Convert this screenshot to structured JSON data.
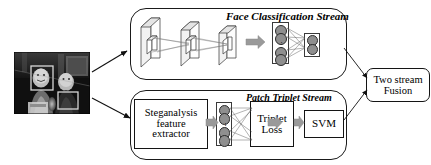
{
  "figure": {
    "type": "two-stream-architecture-diagram",
    "input": {
      "name": "input-photo",
      "description": "grayscale photograph of two people with face and patch detection boxes"
    },
    "streams": [
      {
        "id": "face",
        "title": "Face Classification Stream",
        "stages": [
          "cnn-conv-blocks",
          "fully-connected-layers"
        ]
      },
      {
        "id": "patch",
        "title": "Patch Triplet Stream",
        "stages": [
          "Steganalysis feature extractor",
          "fully-connected-layers",
          "Triplet Loss",
          "SVM"
        ]
      }
    ],
    "boxes": {
      "steganalysis": "Steganalysis\nfeature\nextractor",
      "steganalysis_lines": [
        "Steganalysis",
        "feature",
        "extractor"
      ],
      "triplet_lines": [
        "Triplet",
        "Loss"
      ],
      "svm": "SVM",
      "fusion_lines": [
        "Two stream",
        "Fusion"
      ]
    },
    "colors": {
      "stroke": "#141414",
      "node_fill": "#8f8f8f",
      "block_arrow": "#9a9a9a",
      "panel_border": "#1a1a1a",
      "background": "#ffffff"
    }
  }
}
